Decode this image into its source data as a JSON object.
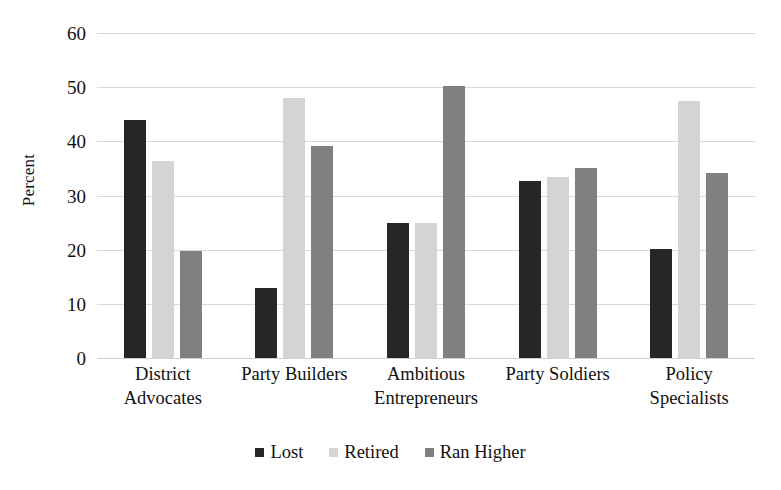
{
  "chart_data": {
    "type": "bar",
    "title": "",
    "xlabel": "",
    "ylabel": "Percent",
    "ylim": [
      0,
      60
    ],
    "yticks": [
      0,
      10,
      20,
      30,
      40,
      50,
      60
    ],
    "ytick_labels": [
      "0",
      "10",
      "20",
      "30",
      "40",
      "50",
      "60"
    ],
    "grid": true,
    "legend_position": "bottom-center",
    "categories": [
      "District Advocates",
      "Party Builders",
      "Ambitious Entrepreneurs",
      "Party Soldiers",
      "Policy Specialists"
    ],
    "category_lines": [
      [
        "District",
        "Advocates"
      ],
      [
        "Party Builders"
      ],
      [
        "Ambitious",
        "Entrepreneurs"
      ],
      [
        "Party Soldiers"
      ],
      [
        "Policy",
        "Specialists"
      ]
    ],
    "series": [
      {
        "name": "Lost",
        "color": "#262626",
        "values": [
          44.0,
          13.0,
          25.0,
          32.7,
          20.2
        ]
      },
      {
        "name": "Retired",
        "color": "#d4d4d4",
        "values": [
          36.4,
          48.0,
          25.0,
          33.4,
          47.4
        ]
      },
      {
        "name": "Ran Higher",
        "color": "#808080",
        "values": [
          19.8,
          39.2,
          50.3,
          35.0,
          34.2
        ]
      }
    ]
  },
  "legend": {
    "items": [
      {
        "label": "Lost",
        "color": "#262626"
      },
      {
        "label": "Retired",
        "color": "#d4d4d4"
      },
      {
        "label": "Ran Higher",
        "color": "#808080"
      }
    ]
  },
  "axis": {
    "y_title": "Percent"
  },
  "colors": {
    "gridline": "#d9d9d9",
    "text": "#111111",
    "background": "#ffffff"
  }
}
